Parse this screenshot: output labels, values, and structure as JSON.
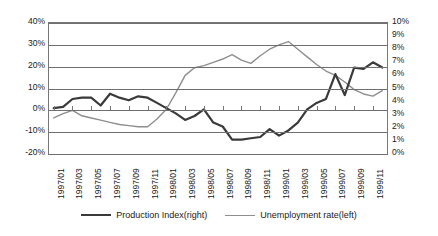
{
  "chart_data": {
    "type": "line",
    "title": "",
    "xlabel": "",
    "grid": "horizontal",
    "legend_position": "bottom",
    "x": [
      "1997/01",
      "1997/02",
      "1997/03",
      "1997/04",
      "1997/05",
      "1997/06",
      "1997/07",
      "1997/08",
      "1997/09",
      "1997/10",
      "1997/11",
      "1997/12",
      "1998/01",
      "1998/02",
      "1998/03",
      "1998/04",
      "1998/05",
      "1998/06",
      "1998/07",
      "1998/08",
      "1998/09",
      "1998/10",
      "1998/11",
      "1998/12",
      "1999/01",
      "1999/02",
      "1999/03",
      "1999/04",
      "1999/05",
      "1999/06",
      "1999/07",
      "1999/08",
      "1999/09",
      "1999/10",
      "1999/11",
      "1999/12"
    ],
    "xtick_labels": [
      "1997/01",
      "1997/03",
      "1997/05",
      "1997/07",
      "1997/09",
      "1997/11",
      "1998/01",
      "1998/03",
      "1998/05",
      "1998/07",
      "1998/09",
      "1998/11",
      "1999/01",
      "1999/03",
      "1999/05",
      "1999/07",
      "1999/09",
      "1999/11"
    ],
    "axes": {
      "left": {
        "name": "left-axis",
        "ylim": [
          -20,
          40
        ],
        "tick_step": 10,
        "tick_labels": [
          "40%",
          "30%",
          "20%",
          "10%",
          "0%",
          "-10%",
          "-20%"
        ],
        "tick_values": [
          40,
          30,
          20,
          10,
          0,
          -10,
          -20
        ],
        "series_ref": "Unemployment rate(left)"
      },
      "right": {
        "name": "right-axis",
        "ylim": [
          0,
          10
        ],
        "tick_step": 1,
        "tick_labels": [
          "10%",
          "9%",
          "8%",
          "7%",
          "6%",
          "5%",
          "4%",
          "3%",
          "2%",
          "1%",
          "0%"
        ],
        "tick_values": [
          10,
          9,
          8,
          7,
          6,
          5,
          4,
          3,
          2,
          1,
          0
        ],
        "series_ref": "Production Index(right)"
      }
    },
    "series": [
      {
        "name": "Production Index(right)",
        "axis": "right",
        "color": "#3a3a3a",
        "width": 2.2,
        "unit": "%",
        "values": [
          3.5,
          3.6,
          4.2,
          4.3,
          4.3,
          3.7,
          4.6,
          4.3,
          4.1,
          4.4,
          4.3,
          3.9,
          3.5,
          3.1,
          2.6,
          2.9,
          3.4,
          2.4,
          2.1,
          1.1,
          1.1,
          1.2,
          1.3,
          1.9,
          1.4,
          1.8,
          2.4,
          3.4,
          3.9,
          4.2,
          6.1,
          4.5,
          6.6,
          6.5,
          7.0,
          6.6
        ]
      },
      {
        "name": "Unemployment rate(left)",
        "axis": "left",
        "color": "#8e8e8e",
        "width": 1.4,
        "unit": "%",
        "values": [
          -3.5,
          -1.5,
          0.0,
          -2.5,
          -3.5,
          -4.5,
          -5.5,
          -6.5,
          -7.0,
          -7.5,
          -7.5,
          -4.0,
          0.5,
          8.0,
          16.0,
          19.5,
          20.5,
          22.0,
          23.5,
          25.5,
          23.0,
          21.5,
          25.0,
          28.0,
          30.0,
          31.5,
          28.0,
          24.5,
          21.0,
          18.0,
          16.0,
          13.0,
          9.5,
          7.5,
          6.5,
          9.0
        ]
      }
    ]
  },
  "legend": {
    "items": [
      {
        "label": "Production Index(right)",
        "key": "prod"
      },
      {
        "label": "Unemployment rate(left)",
        "key": "unemp"
      }
    ]
  }
}
